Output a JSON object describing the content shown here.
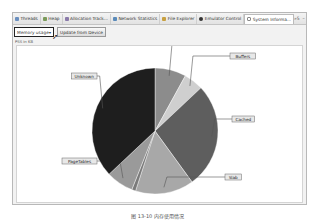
{
  "tabs": [
    {
      "label": "Threads",
      "icon": "threads-icon",
      "color": "#6a8fbf"
    },
    {
      "label": "Heap",
      "icon": "heap-icon",
      "color": "#7a9a5a"
    },
    {
      "label": "Allocation Track...",
      "icon": "allocation-icon",
      "color": "#8a7aaa"
    },
    {
      "label": "Network Statistics",
      "icon": "network-icon",
      "color": "#5a8aba"
    },
    {
      "label": "File Explorer",
      "icon": "file-icon",
      "color": "#c8a040"
    },
    {
      "label": "Emulator Control",
      "icon": "emulator-icon",
      "color": "#333333"
    },
    {
      "label": "System Informa...",
      "icon": "sysinfo-icon",
      "color": "#8a8a8a",
      "active": true
    }
  ],
  "window_controls": {
    "overflow": "»5",
    "minimize": "–",
    "maximize": "□"
  },
  "toolbar": {
    "select_value": "Memory usage",
    "select_arrow": "▾",
    "update_button": "Update from Device"
  },
  "sublabel": "PSS in KB",
  "caption": "图 13-10 内存使用情况",
  "chart_data": {
    "type": "pie",
    "title": "",
    "start_angle_deg": 0,
    "slices": [
      {
        "label": "Free",
        "value": 8,
        "color": "#8c8c8c"
      },
      {
        "label": "Buffers",
        "value": 5,
        "color": "#cfcfcf"
      },
      {
        "label": "Cached",
        "value": 27,
        "color": "#5e5e5e"
      },
      {
        "label": "Slab",
        "value": 15,
        "color": "#a8a8a8"
      },
      {
        "label": "Other",
        "value": 1,
        "color": "#7a7a7a"
      },
      {
        "label": "PageTables",
        "value": 7,
        "color": "#9a9a9a"
      },
      {
        "label": "Unknown",
        "value": 37,
        "color": "#1e1e1e"
      }
    ]
  }
}
